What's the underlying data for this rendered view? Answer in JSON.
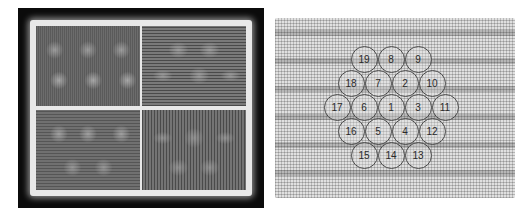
{
  "left_figure": {
    "description": "Four-quadrant intensity pattern image inside a black frame",
    "quadrants": [
      "top-left",
      "top-right",
      "bottom-left",
      "bottom-right"
    ]
  },
  "right_figure": {
    "description": "Hexagonal arrangement of 19 numbered circles over a woven grid pattern",
    "cells": [
      {
        "label": "19",
        "cx": 364,
        "cy": 59
      },
      {
        "label": "8",
        "cx": 391,
        "cy": 59
      },
      {
        "label": "9",
        "cx": 418,
        "cy": 59
      },
      {
        "label": "18",
        "cx": 351,
        "cy": 83
      },
      {
        "label": "7",
        "cx": 378,
        "cy": 83
      },
      {
        "label": "2",
        "cx": 405,
        "cy": 83
      },
      {
        "label": "10",
        "cx": 432,
        "cy": 83
      },
      {
        "label": "17",
        "cx": 337,
        "cy": 107
      },
      {
        "label": "6",
        "cx": 364,
        "cy": 107
      },
      {
        "label": "1",
        "cx": 391,
        "cy": 107
      },
      {
        "label": "3",
        "cx": 418,
        "cy": 107
      },
      {
        "label": "11",
        "cx": 445,
        "cy": 107
      },
      {
        "label": "16",
        "cx": 351,
        "cy": 131
      },
      {
        "label": "5",
        "cx": 378,
        "cy": 131
      },
      {
        "label": "4",
        "cx": 405,
        "cy": 131
      },
      {
        "label": "12",
        "cx": 432,
        "cy": 131
      },
      {
        "label": "15",
        "cx": 364,
        "cy": 155
      },
      {
        "label": "14",
        "cx": 391,
        "cy": 155
      },
      {
        "label": "13",
        "cx": 418,
        "cy": 155
      }
    ]
  }
}
